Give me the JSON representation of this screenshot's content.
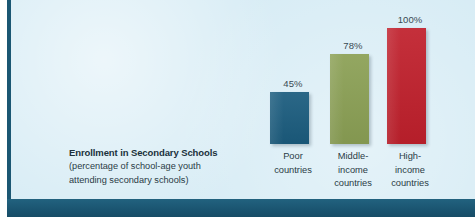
{
  "chart_data": {
    "type": "bar",
    "title": "Enrollment in Secondary Schools",
    "subtitle_lines": [
      "(percentage of school-age youth",
      "attending secondary schools)"
    ],
    "xlabel": "",
    "ylabel": "",
    "ylim": [
      0,
      100
    ],
    "grid": false,
    "legend": "none",
    "categories": [
      "Poor countries",
      "Middle-income countries",
      "High-income countries"
    ],
    "category_label_lines": [
      [
        "Poor",
        "countries"
      ],
      [
        "Middle-",
        "income",
        "countries"
      ],
      [
        "High-",
        "income",
        "countries"
      ]
    ],
    "values": [
      45,
      78,
      100
    ],
    "value_labels": [
      "45%",
      "78%",
      "100%"
    ],
    "bar_colors": [
      "#1b5c7e",
      "#8ba055",
      "#c0202c"
    ]
  },
  "style": {
    "panel_background": "#d7ecf5",
    "accent_band": "#1b5773",
    "text_color": "#2a3b45"
  }
}
